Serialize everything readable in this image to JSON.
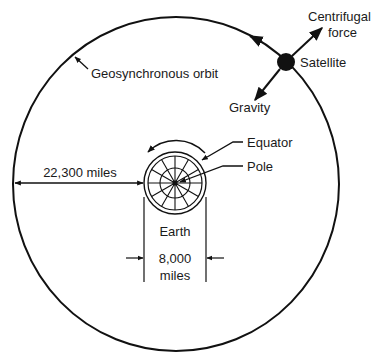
{
  "diagram": {
    "labels": {
      "orbit": "Geosynchronous orbit",
      "satellite": "Satellite",
      "centrifugal_line1": "Centrifugal",
      "centrifugal_line2": "force",
      "gravity": "Gravity",
      "equator": "Equator",
      "pole": "Pole",
      "earth": "Earth",
      "orbit_distance": "22,300 miles",
      "earth_diameter_line1": "8,000",
      "earth_diameter_line2": "miles"
    },
    "colors": {
      "line": "#111111",
      "text": "#1a1a1a",
      "background": "#ffffff"
    }
  }
}
